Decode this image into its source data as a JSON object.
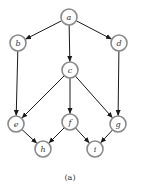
{
  "diagram": {
    "caption": "(a)",
    "colors": {
      "node_stroke": "#8a8a8a",
      "edge": "#1a1a1a",
      "text": "#333333"
    },
    "nodes": [
      {
        "id": "a",
        "label": "a",
        "x": 69,
        "y": 17
      },
      {
        "id": "b",
        "label": "b",
        "x": 18,
        "y": 43
      },
      {
        "id": "d",
        "label": "d",
        "x": 119,
        "y": 43
      },
      {
        "id": "c",
        "label": "c",
        "x": 70,
        "y": 70
      },
      {
        "id": "e",
        "label": "e",
        "x": 16,
        "y": 124
      },
      {
        "id": "f",
        "label": "f",
        "x": 70,
        "y": 122
      },
      {
        "id": "g",
        "label": "g",
        "x": 118,
        "y": 124
      },
      {
        "id": "h",
        "label": "h",
        "x": 43,
        "y": 149
      },
      {
        "id": "i",
        "label": "i",
        "x": 95,
        "y": 149
      }
    ],
    "edges": [
      {
        "from": "a",
        "to": "b"
      },
      {
        "from": "a",
        "to": "c"
      },
      {
        "from": "a",
        "to": "d"
      },
      {
        "from": "b",
        "to": "e"
      },
      {
        "from": "c",
        "to": "e"
      },
      {
        "from": "c",
        "to": "f"
      },
      {
        "from": "c",
        "to": "g"
      },
      {
        "from": "d",
        "to": "g"
      },
      {
        "from": "e",
        "to": "h"
      },
      {
        "from": "f",
        "to": "h"
      },
      {
        "from": "f",
        "to": "i"
      },
      {
        "from": "g",
        "to": "i"
      }
    ]
  }
}
